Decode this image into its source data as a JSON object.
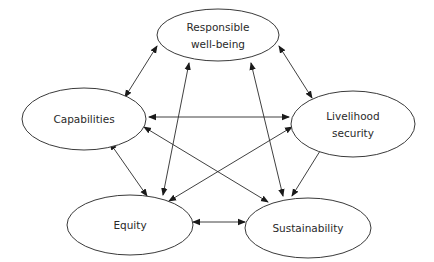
{
  "diagram": {
    "nodes": [
      {
        "id": "rwb",
        "lines": [
          "Responsible",
          "well-being"
        ],
        "cx": 218,
        "cy": 35,
        "rx": 61,
        "ry": 26
      },
      {
        "id": "cap",
        "lines": [
          "Capabilities"
        ],
        "cx": 84,
        "cy": 119,
        "rx": 62,
        "ry": 31
      },
      {
        "id": "ls",
        "lines": [
          "Livelihood",
          "security"
        ],
        "cx": 353,
        "cy": 124,
        "rx": 62,
        "ry": 33
      },
      {
        "id": "eq",
        "lines": [
          "Equity"
        ],
        "cx": 130,
        "cy": 225,
        "rx": 63,
        "ry": 30
      },
      {
        "id": "sus",
        "lines": [
          "Sustainability"
        ],
        "cx": 308,
        "cy": 228,
        "rx": 63,
        "ry": 30
      }
    ],
    "edges": [
      {
        "from": "rwb",
        "to": "cap",
        "x1": 157,
        "y1": 46,
        "x2": 125,
        "y2": 97,
        "bidirectional": true
      },
      {
        "from": "rwb",
        "to": "ls",
        "x1": 279,
        "y1": 46,
        "x2": 312,
        "y2": 98,
        "bidirectional": true
      },
      {
        "from": "rwb",
        "to": "eq",
        "x1": 189,
        "y1": 63,
        "x2": 163,
        "y2": 195,
        "bidirectional": true
      },
      {
        "from": "rwb",
        "to": "sus",
        "x1": 251,
        "y1": 63,
        "x2": 283,
        "y2": 196,
        "bidirectional": true
      },
      {
        "from": "cap",
        "to": "ls",
        "x1": 149,
        "y1": 117,
        "x2": 289,
        "y2": 117,
        "bidirectional": true
      },
      {
        "from": "cap",
        "to": "sus",
        "x1": 144,
        "y1": 127,
        "x2": 268,
        "y2": 202,
        "bidirectional": true
      },
      {
        "from": "cap",
        "to": "eq",
        "x1": 110,
        "y1": 143,
        "x2": 147,
        "y2": 196,
        "bidirectional": true
      },
      {
        "from": "ls",
        "to": "eq",
        "x1": 292,
        "y1": 127,
        "x2": 169,
        "y2": 201,
        "bidirectional": true
      },
      {
        "from": "ls",
        "to": "sus",
        "x1": 325,
        "y1": 143,
        "x2": 292,
        "y2": 196,
        "bidirectional": true
      },
      {
        "from": "eq",
        "to": "sus",
        "x1": 193,
        "y1": 222,
        "x2": 245,
        "y2": 222,
        "bidirectional": true
      }
    ],
    "colors": {
      "stroke": "#2a2a2a",
      "fill": "#ffffff",
      "background": "#ffffff"
    }
  }
}
